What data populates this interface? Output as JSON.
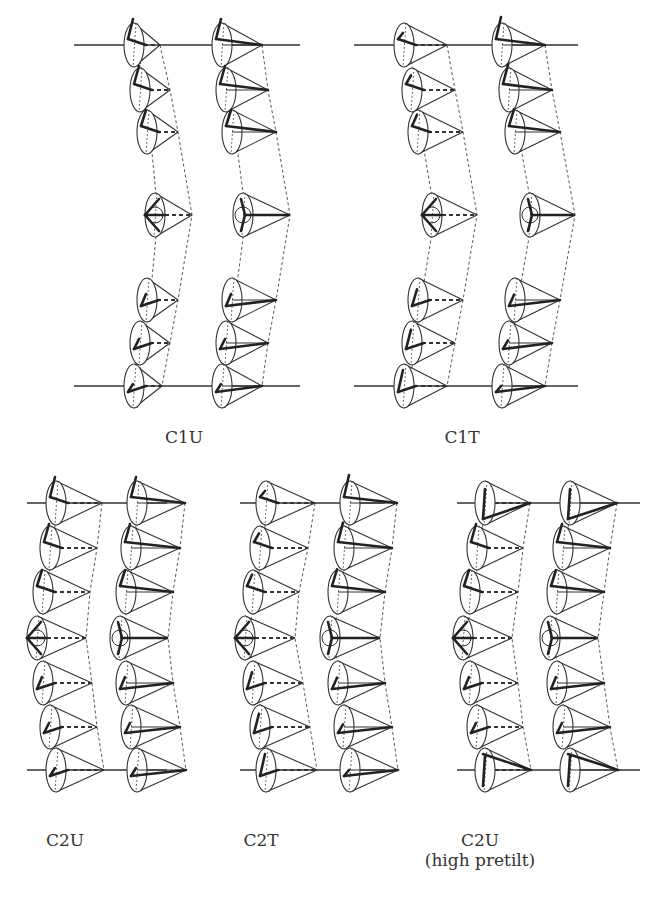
{
  "figure": {
    "panels": [
      {
        "id": "C1U",
        "label": "C1U",
        "sublabel": "",
        "label_pos": [
          184,
          427
        ],
        "plates": {
          "top_y": 45,
          "bottom_y": 386,
          "x1": 74,
          "x2": 300
        },
        "columns": [
          {
            "twist": false,
            "cones": [
              {
                "bx": 134,
                "y": 45,
                "ax": 160
              },
              {
                "bx": 140,
                "y": 90,
                "ax": 170
              },
              {
                "bx": 147,
                "y": 132,
                "ax": 178
              },
              {
                "bx": 155,
                "y": 215,
                "ax": 192
              },
              {
                "bx": 147,
                "y": 300,
                "ax": 178
              },
              {
                "bx": 140,
                "y": 343,
                "ax": 170
              },
              {
                "bx": 134,
                "y": 386,
                "ax": 162
              }
            ]
          },
          {
            "twist": false,
            "solid": true,
            "cones": [
              {
                "bx": 222,
                "y": 45,
                "ax": 262
              },
              {
                "bx": 226,
                "y": 90,
                "ax": 268
              },
              {
                "bx": 232,
                "y": 132,
                "ax": 276
              },
              {
                "bx": 243,
                "y": 215,
                "ax": 290
              },
              {
                "bx": 232,
                "y": 300,
                "ax": 276
              },
              {
                "bx": 226,
                "y": 343,
                "ax": 268
              },
              {
                "bx": 222,
                "y": 386,
                "ax": 262
              }
            ]
          }
        ]
      },
      {
        "id": "C1T",
        "label": "C1T",
        "sublabel": "",
        "label_pos": [
          462,
          427
        ],
        "plates": {
          "top_y": 45,
          "bottom_y": 386,
          "x1": 354,
          "x2": 578
        },
        "columns": [
          {
            "twist": true,
            "cones": [
              {
                "bx": 404,
                "y": 45,
                "ax": 447
              },
              {
                "bx": 412,
                "y": 90,
                "ax": 455
              },
              {
                "bx": 418,
                "y": 132,
                "ax": 463
              },
              {
                "bx": 432,
                "y": 215,
                "ax": 477
              },
              {
                "bx": 418,
                "y": 300,
                "ax": 463
              },
              {
                "bx": 412,
                "y": 343,
                "ax": 455
              },
              {
                "bx": 404,
                "y": 386,
                "ax": 447
              }
            ]
          },
          {
            "twist": true,
            "solid": true,
            "cones": [
              {
                "bx": 502,
                "y": 45,
                "ax": 545
              },
              {
                "bx": 509,
                "y": 90,
                "ax": 552
              },
              {
                "bx": 515,
                "y": 132,
                "ax": 560
              },
              {
                "bx": 530,
                "y": 215,
                "ax": 575
              },
              {
                "bx": 515,
                "y": 300,
                "ax": 560
              },
              {
                "bx": 509,
                "y": 343,
                "ax": 552
              },
              {
                "bx": 502,
                "y": 386,
                "ax": 545
              }
            ]
          }
        ]
      },
      {
        "id": "C2U",
        "label": "C2U",
        "sublabel": "",
        "label_pos": [
          65,
          830
        ],
        "plates": {
          "top_y": 503,
          "bottom_y": 770,
          "x1": 27,
          "x2": 167
        },
        "columns": [
          {
            "twist": false,
            "cones": [
              {
                "bx": 56,
                "y": 503,
                "ax": 102
              },
              {
                "bx": 50,
                "y": 548,
                "ax": 97
              },
              {
                "bx": 43,
                "y": 592,
                "ax": 90
              },
              {
                "bx": 37,
                "y": 638,
                "ax": 86
              },
              {
                "bx": 43,
                "y": 683,
                "ax": 92
              },
              {
                "bx": 50,
                "y": 727,
                "ax": 97
              },
              {
                "bx": 56,
                "y": 770,
                "ax": 104
              }
            ]
          },
          {
            "twist": false,
            "solid": true,
            "cones": [
              {
                "bx": 137,
                "y": 503,
                "ax": 185
              },
              {
                "bx": 131,
                "y": 548,
                "ax": 180
              },
              {
                "bx": 126,
                "y": 592,
                "ax": 173
              },
              {
                "bx": 120,
                "y": 638,
                "ax": 168
              },
              {
                "bx": 126,
                "y": 683,
                "ax": 173
              },
              {
                "bx": 131,
                "y": 727,
                "ax": 180
              },
              {
                "bx": 137,
                "y": 770,
                "ax": 186
              }
            ]
          }
        ]
      },
      {
        "id": "C2T",
        "label": "C2T",
        "sublabel": "",
        "label_pos": [
          261,
          830
        ],
        "plates": {
          "top_y": 503,
          "bottom_y": 770,
          "x1": 240,
          "x2": 385
        },
        "columns": [
          {
            "twist": true,
            "cones": [
              {
                "bx": 266,
                "y": 503,
                "ax": 315
              },
              {
                "bx": 260,
                "y": 548,
                "ax": 308
              },
              {
                "bx": 253,
                "y": 592,
                "ax": 299
              },
              {
                "bx": 245,
                "y": 638,
                "ax": 295
              },
              {
                "bx": 253,
                "y": 683,
                "ax": 303
              },
              {
                "bx": 260,
                "y": 727,
                "ax": 310
              },
              {
                "bx": 266,
                "y": 770,
                "ax": 317
              }
            ]
          },
          {
            "twist": true,
            "solid": true,
            "cones": [
              {
                "bx": 350,
                "y": 503,
                "ax": 397
              },
              {
                "bx": 344,
                "y": 548,
                "ax": 392
              },
              {
                "bx": 338,
                "y": 592,
                "ax": 385
              },
              {
                "bx": 330,
                "y": 638,
                "ax": 380
              },
              {
                "bx": 338,
                "y": 683,
                "ax": 385
              },
              {
                "bx": 344,
                "y": 727,
                "ax": 392
              },
              {
                "bx": 350,
                "y": 770,
                "ax": 398
              }
            ]
          }
        ]
      },
      {
        "id": "C2U-HP",
        "label": "C2U",
        "sublabel": "(high pretilt)",
        "label_pos": [
          480,
          830
        ],
        "plates": {
          "top_y": 503,
          "bottom_y": 770,
          "x1": 457,
          "x2": 640
        },
        "columns": [
          {
            "twist": false,
            "high_pretilt": true,
            "cones": [
              {
                "bx": 485,
                "y": 503,
                "ax": 530
              },
              {
                "bx": 477,
                "y": 548,
                "ax": 523
              },
              {
                "bx": 470,
                "y": 592,
                "ax": 518
              },
              {
                "bx": 463,
                "y": 638,
                "ax": 512
              },
              {
                "bx": 470,
                "y": 683,
                "ax": 518
              },
              {
                "bx": 477,
                "y": 727,
                "ax": 523
              },
              {
                "bx": 485,
                "y": 770,
                "ax": 531
              }
            ]
          },
          {
            "twist": false,
            "solid": true,
            "high_pretilt": true,
            "cones": [
              {
                "bx": 570,
                "y": 503,
                "ax": 617
              },
              {
                "bx": 563,
                "y": 548,
                "ax": 610
              },
              {
                "bx": 557,
                "y": 592,
                "ax": 604
              },
              {
                "bx": 550,
                "y": 638,
                "ax": 598
              },
              {
                "bx": 557,
                "y": 683,
                "ax": 604
              },
              {
                "bx": 563,
                "y": 727,
                "ax": 610
              },
              {
                "bx": 570,
                "y": 770,
                "ax": 618
              }
            ]
          }
        ]
      }
    ],
    "colors": {
      "stroke": "#333333",
      "background": "#ffffff"
    }
  }
}
